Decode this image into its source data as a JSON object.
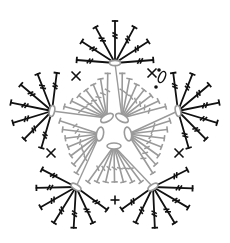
{
  "diagram": {
    "type": "crochet-chart",
    "title": "",
    "center": [
      115,
      124
    ],
    "colors": {
      "inner": "#9a9a9a",
      "outer": "#111111",
      "background": "#ffffff"
    },
    "inner_ring": {
      "stitch": "chain",
      "ovals": [
        {
          "cx": 107,
          "cy": 118,
          "rx": 7,
          "ry": 3.5,
          "rot": -30
        },
        {
          "cx": 122,
          "cy": 118,
          "rx": 7,
          "ry": 3.5,
          "rot": 30
        },
        {
          "cx": 128,
          "cy": 134,
          "rx": 7,
          "ry": 3.5,
          "rot": 80
        },
        {
          "cx": 114,
          "cy": 146,
          "rx": 7,
          "ry": 3,
          "rot": 0
        },
        {
          "cx": 100,
          "cy": 134,
          "rx": 7,
          "ry": 3.5,
          "rot": -80
        }
      ]
    },
    "outer_points": [
      {
        "name": "top",
        "x": 115,
        "y": 63,
        "rot": 0
      },
      {
        "name": "right",
        "x": 178,
        "y": 111,
        "rot": 75
      },
      {
        "name": "bottom-right",
        "x": 153,
        "y": 187,
        "rot": -30
      },
      {
        "name": "bottom-left",
        "x": 76,
        "y": 187,
        "rot": 30
      },
      {
        "name": "left",
        "x": 52,
        "y": 111,
        "rot": -75
      }
    ],
    "single_crochet_marks": [
      {
        "x": 76,
        "y": 76
      },
      {
        "x": 51,
        "y": 153
      },
      {
        "x": 115,
        "y": 200
      },
      {
        "x": 179,
        "y": 153
      },
      {
        "x": 152,
        "y": 73
      }
    ],
    "gray_fans_per_side": 7,
    "black_fan_stitches": 7,
    "black_fan_length": 42,
    "legend": []
  }
}
